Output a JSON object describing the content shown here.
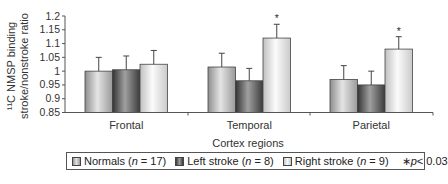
{
  "chart_data": {
    "type": "bar",
    "title": "",
    "xlabel": "Cortex regions",
    "ylabel": "11C NMSP binding stroke/nonstroke ratio",
    "ylabel_line1": "¹¹C NMSP binding",
    "ylabel_line2": "stroke/nonstroke ratio",
    "ylim": [
      0.85,
      1.2
    ],
    "yticks": [
      0.85,
      0.9,
      0.95,
      1.0,
      1.05,
      1.1,
      1.15,
      1.2
    ],
    "ytick_labels": [
      "0.85",
      "0.9",
      "0.95",
      "1",
      "1.05",
      "1.1",
      "1.15",
      "1.2"
    ],
    "grid": false,
    "legend_position": "bottom",
    "categories": [
      "Frontal",
      "Temporal",
      "Parietal"
    ],
    "series": [
      {
        "name": "Normals (n = 17)",
        "label_prefix": "Normals (",
        "label_n": "n",
        "label_suffix": " = 17)",
        "values": [
          1.0,
          1.015,
          0.97
        ],
        "error_upper": [
          1.05,
          1.065,
          1.02
        ],
        "significant": [
          false,
          false,
          false
        ],
        "color": "#bdbdbd"
      },
      {
        "name": "Left stroke (n = 8)",
        "label_prefix": "Left stroke (",
        "label_n": "n",
        "label_suffix": " = 8)",
        "values": [
          1.005,
          0.965,
          0.95
        ],
        "error_upper": [
          1.055,
          1.01,
          1.0
        ],
        "significant": [
          false,
          false,
          false
        ],
        "color": "#6a6a6a"
      },
      {
        "name": "Right stroke (n = 9)",
        "label_prefix": "Right stroke (",
        "label_n": "n",
        "label_suffix": " = 9)",
        "values": [
          1.025,
          1.12,
          1.08
        ],
        "error_upper": [
          1.075,
          1.17,
          1.125
        ],
        "significant": [
          false,
          true,
          true
        ],
        "color": "#e6e6e6"
      }
    ],
    "annotations": [
      {
        "text": "*",
        "category": "Temporal",
        "series": "Right stroke (n = 9)"
      },
      {
        "text": "*",
        "category": "Parietal",
        "series": "Right stroke (n = 9)"
      }
    ],
    "significance_note": "*p < 0.03",
    "significance_star": "∗",
    "significance_p": "p",
    "significance_rest": "< 0.03"
  }
}
